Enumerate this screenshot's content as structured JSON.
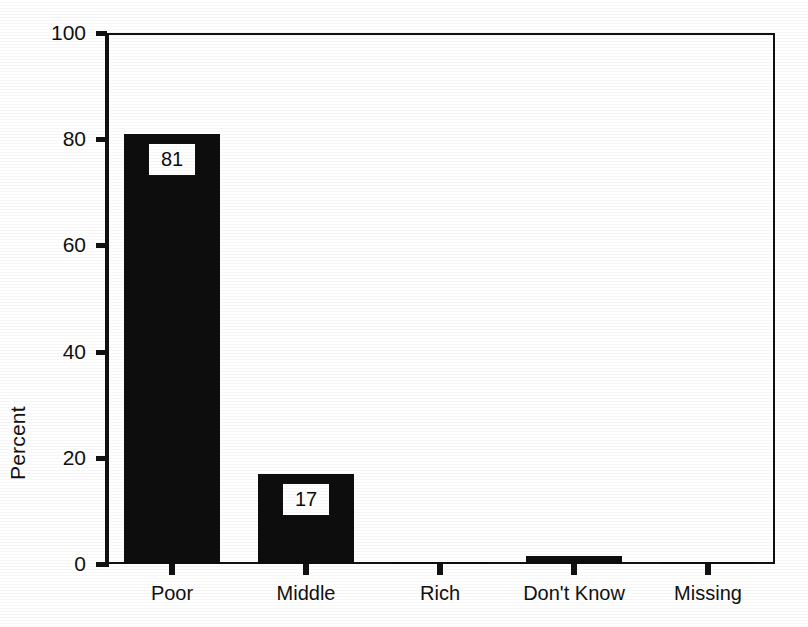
{
  "chart_data": {
    "type": "bar",
    "title": "",
    "subtitle": "",
    "xlabel": "",
    "ylabel": "Percent",
    "categories": [
      "Poor",
      "Middle",
      "Rich",
      "Don't Know",
      "Missing"
    ],
    "values": [
      81,
      17,
      0.3,
      1.5,
      0.3
    ],
    "data_labels": [
      "81",
      "17",
      "",
      "",
      ""
    ],
    "ylim": [
      0,
      100
    ],
    "yticks": [
      0,
      20,
      40,
      60,
      80,
      100
    ],
    "ytick_labels": [
      "0",
      "20",
      "40",
      "60",
      "80",
      "100"
    ],
    "grid": false,
    "legend": "none",
    "bar_color": "#0d0d0d",
    "background_color": "#ffffff",
    "axis_color": "#111111"
  },
  "axes": {
    "y_title": "Percent"
  }
}
